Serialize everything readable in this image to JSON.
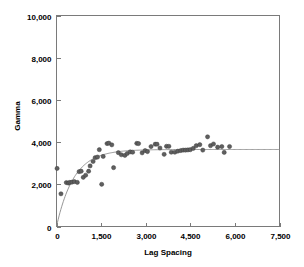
{
  "chart_data": {
    "type": "scatter",
    "title": "",
    "xlabel": "Lag Spacing",
    "ylabel": "Gamma",
    "xlim": [
      0,
      7500
    ],
    "ylim": [
      0,
      10000
    ],
    "xticks": [
      0,
      1500,
      3000,
      4500,
      6000,
      7500
    ],
    "xtick_labels": [
      "0",
      "1,500",
      "3,000",
      "4,500",
      "6,000",
      "7,500"
    ],
    "yticks": [
      0,
      2000,
      4000,
      6000,
      8000,
      10000
    ],
    "ytick_labels": [
      "0",
      "2,000",
      "4,000",
      "6,000",
      "8,000",
      "10,000"
    ],
    "grid": false,
    "legend": false,
    "marker_color": "#5f5f5f",
    "marker_edge_color": "#3a3a3a",
    "curve_color": "#8a8a8a",
    "frame_color": "#7a7a7a",
    "series": [
      {
        "name": "Experimental variogram",
        "kind": "scatter",
        "points": [
          [
            20,
            2750
          ],
          [
            150,
            1550
          ],
          [
            330,
            2080
          ],
          [
            400,
            2060
          ],
          [
            450,
            2090
          ],
          [
            520,
            2100
          ],
          [
            600,
            2130
          ],
          [
            700,
            2090
          ],
          [
            760,
            2600
          ],
          [
            830,
            2620
          ],
          [
            900,
            2330
          ],
          [
            980,
            2430
          ],
          [
            1080,
            2620
          ],
          [
            1130,
            2870
          ],
          [
            1230,
            3080
          ],
          [
            1300,
            3260
          ],
          [
            1380,
            3290
          ],
          [
            1440,
            3640
          ],
          [
            1520,
            2000
          ],
          [
            1570,
            3320
          ],
          [
            1700,
            3930
          ],
          [
            1760,
            3950
          ],
          [
            1860,
            3870
          ],
          [
            1920,
            2790
          ],
          [
            2080,
            3500
          ],
          [
            2180,
            3400
          ],
          [
            2300,
            3370
          ],
          [
            2380,
            3460
          ],
          [
            2480,
            3540
          ],
          [
            2560,
            3520
          ],
          [
            2700,
            3940
          ],
          [
            2760,
            3930
          ],
          [
            2880,
            3490
          ],
          [
            2980,
            3600
          ],
          [
            3060,
            3550
          ],
          [
            3180,
            3790
          ],
          [
            3320,
            3900
          ],
          [
            3380,
            3900
          ],
          [
            3480,
            3720
          ],
          [
            3620,
            3420
          ],
          [
            3700,
            3800
          ],
          [
            3780,
            3800
          ],
          [
            3860,
            3520
          ],
          [
            3980,
            3520
          ],
          [
            4080,
            3570
          ],
          [
            4180,
            3600
          ],
          [
            4260,
            3620
          ],
          [
            4340,
            3620
          ],
          [
            4420,
            3630
          ],
          [
            4500,
            3640
          ],
          [
            4600,
            3700
          ],
          [
            4700,
            3830
          ],
          [
            4820,
            3880
          ],
          [
            4920,
            3620
          ],
          [
            5080,
            4250
          ],
          [
            5180,
            3830
          ],
          [
            5280,
            3910
          ],
          [
            5420,
            3760
          ],
          [
            5560,
            3790
          ],
          [
            5640,
            3510
          ],
          [
            5820,
            3790
          ]
        ]
      },
      {
        "name": "Fitted model",
        "kind": "line",
        "model": "exponential",
        "sill": 3650,
        "nugget": 0,
        "range": 1750,
        "extends_to_x": 7500
      }
    ]
  },
  "axes": {
    "x_title": "Lag Spacing",
    "y_title": "Gamma"
  }
}
